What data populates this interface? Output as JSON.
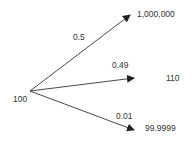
{
  "diagram": {
    "type": "probability-tree",
    "root": {
      "label": "100"
    },
    "branches": [
      {
        "probability": "0.5",
        "outcome": "1,000,000"
      },
      {
        "probability": "0.49",
        "outcome": "110"
      },
      {
        "probability": "0.01",
        "outcome": "99.9999"
      }
    ],
    "colors": {
      "line": "#333333",
      "text": "#333333",
      "background": "#ffffff"
    }
  }
}
